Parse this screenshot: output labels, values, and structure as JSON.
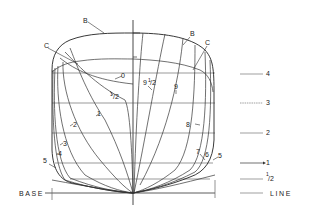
{
  "diagram": {
    "type": "ship body plan (lines drawing)",
    "curve_labels": {
      "B_left": "B",
      "C_left": "C",
      "B_right": "B",
      "C_right": "C",
      "station_0": "0",
      "station_half": "1/2",
      "station_1": "1",
      "station_2": "2",
      "station_3": "3",
      "station_4": "4",
      "station_5_left": "5",
      "station_9_half": "9 1/2",
      "station_9": "9",
      "station_8": "8",
      "station_7": "7",
      "station_6": "6",
      "station_5_right": "5"
    },
    "waterline_labels": [
      {
        "label": "4",
        "y": 74
      },
      {
        "label": "3",
        "y": 103
      },
      {
        "label": "2",
        "y": 133
      },
      {
        "label": "1",
        "y": 163
      },
      {
        "label": "1/2",
        "y": 178
      }
    ],
    "baseline": {
      "left_text": "BASE",
      "right_text": "LINE"
    }
  }
}
